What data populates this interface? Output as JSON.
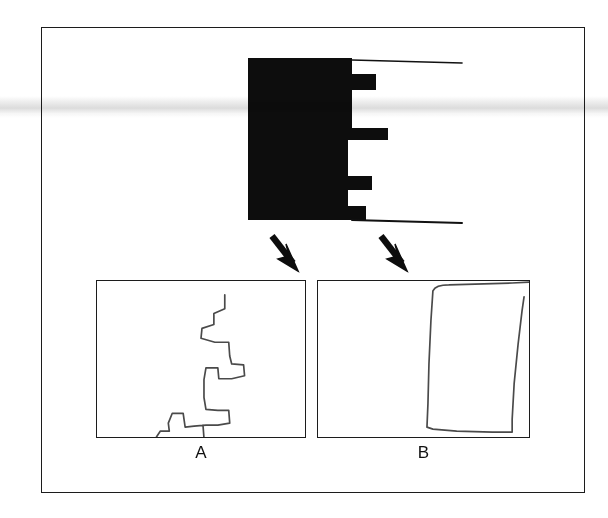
{
  "figure": {
    "background_color": "#ffffff",
    "frame": {
      "border_color": "#1c1c1c",
      "x": 41,
      "y": 27,
      "width": 544,
      "height": 466
    },
    "ink_color": "#111111",
    "trace_color": "#4a4a4a"
  },
  "specimen": {
    "name": "black-silhouette-specimen",
    "description": "solid black profile with stepped notches along right edge",
    "fill_color": "#0d0d0d",
    "bounds": {
      "x": 248,
      "y": 58,
      "width": 112,
      "height": 162
    },
    "top_leader_line": {
      "x1": 352,
      "y1": 61,
      "x2": 460,
      "y2": 64
    },
    "bottom_leader_line": {
      "x1": 352,
      "y1": 219,
      "x2": 460,
      "y2": 222
    },
    "right_edge_steps": [
      {
        "y": 58,
        "x": 352
      },
      {
        "y": 74,
        "x": 376
      },
      {
        "y": 96,
        "x": 352
      },
      {
        "y": 128,
        "x": 388
      },
      {
        "y": 140,
        "x": 348
      },
      {
        "y": 176,
        "x": 372
      },
      {
        "y": 190,
        "x": 348
      },
      {
        "y": 206,
        "x": 366
      },
      {
        "y": 220,
        "x": 352
      }
    ]
  },
  "arrows": [
    {
      "name": "arrow-to-panel-a",
      "direction": "down-right",
      "x1": 272,
      "y1": 236,
      "x2": 296,
      "y2": 268
    },
    {
      "name": "arrow-to-panel-b",
      "direction": "down-right",
      "x1": 380,
      "y1": 236,
      "x2": 404,
      "y2": 268
    }
  ],
  "panels": [
    {
      "id": "a",
      "caption": "A",
      "name": "detail-panel-a",
      "content_name": "jagged-staircase-trace",
      "description": "hand-drawn irregular stepped / zigzag outline",
      "x": 96,
      "y": 280,
      "width": 210,
      "height": 158,
      "path": "M 129 14 L 129 28 L 118 33 L 118 44 L 106 48 L 105 58 L 119 62 L 133 62 L 134 76 L 136 84 L 148 85 L 149 96 L 136 99 L 123 99 L 122 88 L 110 88 L 108 100 L 108 118 L 110 130 L 122 131 L 133 131 L 134 144 L 122 146 L 110 146 L 98 147 L 89 148 L 87 134 L 76 134 L 72 144 L 73 152 L 64 152 L 60 158 L 64 163 L 76 163 L 88 162 L 100 161 L 108 159 L 107 146"
    },
    {
      "id": "b",
      "caption": "B",
      "name": "detail-panel-b",
      "content_name": "rectangular-block-trace",
      "description": "hand-drawn tall quadrilateral outline at right of panel",
      "x": 317,
      "y": 280,
      "width": 213,
      "height": 158,
      "path": "M 116 10 C 118 6 124 4 132 4 L 196 2 L 216 1 M 116 10 L 114 40 L 112 84 L 111 124 L 110 148 L 116 150 L 140 152 L 176 153 L 196 153 L 196 140 L 198 104 L 202 64 L 206 30 L 208 16"
    }
  ],
  "labels": {
    "panel_a": "A",
    "panel_b": "B"
  }
}
